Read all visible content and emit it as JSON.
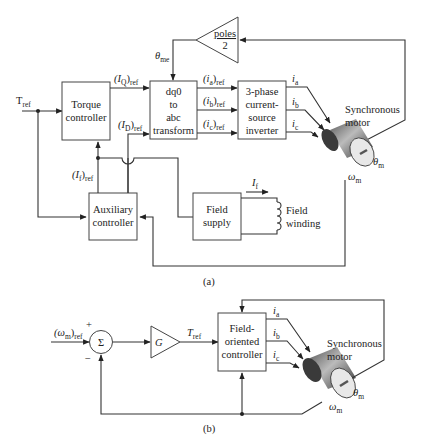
{
  "diagram_a": {
    "caption": "(a)",
    "input": {
      "main": "T",
      "sub": "ref"
    },
    "blocks": {
      "torque_controller": [
        "Torque",
        "controller"
      ],
      "dq0_transform": [
        "dq0",
        "to",
        "abc",
        "transform"
      ],
      "inverter": [
        "3-phase",
        "current-",
        "source",
        "inverter"
      ],
      "auxiliary_controller": [
        "Auxiliary",
        "controller"
      ],
      "field_supply": [
        "Field",
        "supply"
      ],
      "poles_gain": {
        "num": "poles",
        "den": "2"
      }
    },
    "signals": {
      "iq_ref": {
        "main": "(I",
        "sub1": "Q",
        "close": ")",
        "sub2": "ref"
      },
      "id_ref": {
        "main": "(I",
        "sub1": "D",
        "close": ")",
        "sub2": "ref"
      },
      "if_ref": {
        "main": "(I",
        "sub1": "f",
        "close": ")",
        "sub2": "ref"
      },
      "ia_ref": {
        "main": "(i",
        "sub1": "a",
        "close": ")",
        "sub2": "ref"
      },
      "ib_ref": {
        "main": "(i",
        "sub1": "b",
        "close": ")",
        "sub2": "ref"
      },
      "ic_ref": {
        "main": "(i",
        "sub1": "c",
        "close": ")",
        "sub2": "ref"
      },
      "ia": {
        "main": "i",
        "sub": "a"
      },
      "ib": {
        "main": "i",
        "sub": "b"
      },
      "ic": {
        "main": "i",
        "sub": "c"
      },
      "theta_me": {
        "main": "θ",
        "sub": "me"
      },
      "theta_m": {
        "main": "θ",
        "sub": "m"
      },
      "omega_m": {
        "main": "ω",
        "sub": "m"
      },
      "i_f": {
        "main": "I",
        "sub": "f"
      }
    },
    "motor_label": [
      "Synchronous",
      "motor"
    ],
    "field_winding_label": [
      "Field",
      "winding"
    ]
  },
  "diagram_b": {
    "caption": "(b)",
    "input": {
      "main": "(ω",
      "sub1": "m",
      "close": ")",
      "sub2": "ref"
    },
    "plus": "+",
    "minus": "−",
    "summer": "Σ",
    "gain": "G",
    "tref": {
      "main": "T",
      "sub": "ref"
    },
    "controller": [
      "Field-",
      "oriented",
      "controller"
    ],
    "signals": {
      "ia": {
        "main": "i",
        "sub": "a"
      },
      "ib": {
        "main": "i",
        "sub": "b"
      },
      "ic": {
        "main": "i",
        "sub": "c"
      },
      "theta_m": {
        "main": "θ",
        "sub": "m"
      },
      "omega_m": {
        "main": "ω",
        "sub": "m"
      }
    },
    "motor_label": [
      "Synchronous",
      "motor"
    ]
  }
}
